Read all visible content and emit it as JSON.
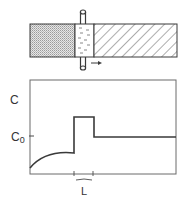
{
  "diagram": {
    "bar": {
      "regions": [
        {
          "name": "refined-solid",
          "pattern": "dotted"
        },
        {
          "name": "molten-zone",
          "pattern": "liquid-dashes"
        },
        {
          "name": "unrefined-solid",
          "pattern": "hatched"
        }
      ],
      "heater_direction": "right"
    },
    "graph": {
      "y_label": "C",
      "c0_label": "C",
      "c0_subscript": "0",
      "zone_length_label": "L"
    }
  },
  "colors": {
    "line": "#3a3a3a",
    "dots": "#9a9a9a",
    "background": "#ffffff"
  }
}
